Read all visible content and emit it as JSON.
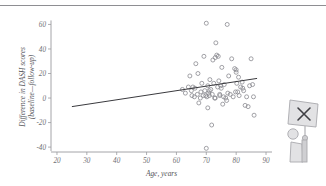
{
  "figure": {
    "has_top_rule": true,
    "background_color": "#ffffff"
  },
  "watermark": {
    "name": "person-holding-sign-with-x",
    "sign_glyph": "X"
  },
  "chart_data": {
    "type": "scatter",
    "title": "",
    "subtitle": "",
    "xlabel": "Age, years",
    "ylabel": "Difference in DASH scores (baseline—follow-up)",
    "ylabel_line1": "Difference in DASH scores",
    "ylabel_line2": "(baseline—follow-up)",
    "xlim": [
      18,
      92
    ],
    "ylim": [
      -44,
      62
    ],
    "xticks": [
      20,
      30,
      40,
      50,
      60,
      70,
      80,
      90
    ],
    "xtick_labels": [
      "20",
      "30",
      "40",
      "50",
      "60",
      "70",
      "80",
      "90"
    ],
    "yticks": [
      -40,
      -20,
      0,
      20,
      40,
      60
    ],
    "ytick_labels": [
      "-40",
      "-20",
      "0",
      "20",
      "40",
      "60"
    ],
    "grid": false,
    "legend": null,
    "marker_style": "open-circle",
    "marker_color": "#8a8a90",
    "trendline": {
      "type": "linear-fit",
      "color": "#3a3a3e",
      "x_start": 25,
      "y_start": -7,
      "x_end": 87,
      "y_end": 16
    },
    "x": [
      64.5,
      65.0,
      65.2,
      65.5,
      66.0,
      66.2,
      66.5,
      67.0,
      67.2,
      67.5,
      68.0,
      68.2,
      68.5,
      69.0,
      69.2,
      69.5,
      70.0,
      70.0,
      70.2,
      70.5,
      70.5,
      70.8,
      71.0,
      71.2,
      71.5,
      71.8,
      72.0,
      72.2,
      72.5,
      72.8,
      73.0,
      73.2,
      73.5,
      73.8,
      74.0,
      74.2,
      74.5,
      74.8,
      75.0,
      75.2,
      75.5,
      75.8,
      76.0,
      76.5,
      77.0,
      77.2,
      77.5,
      78.0,
      78.5,
      79.0,
      79.5,
      80.0,
      80.0,
      80.2,
      80.5,
      80.8,
      81.0,
      81.5,
      82.0,
      82.5,
      83.0,
      83.5,
      84.0,
      84.5,
      85.0,
      85.5,
      86.0,
      62.0,
      63.0,
      64.0,
      69.8,
      71.0,
      73.0,
      74.5,
      76.8,
      79.8,
      82.2,
      85.8
    ],
    "y": [
      18.0,
      6.0,
      2.0,
      9.0,
      1.0,
      8.0,
      28.0,
      3.0,
      20.0,
      -4.0,
      0.0,
      5.0,
      12.0,
      2.0,
      34.0,
      6.0,
      61.0,
      -41.0,
      1.0,
      10.0,
      -8.0,
      4.0,
      2.0,
      15.0,
      7.0,
      -22.0,
      3.0,
      31.0,
      12.0,
      0.0,
      33.0,
      45.0,
      35.0,
      9.0,
      34.0,
      14.0,
      2.0,
      10.0,
      8.0,
      25.0,
      -5.0,
      1.0,
      11.0,
      0.0,
      60.0,
      4.0,
      18.0,
      3.0,
      32.0,
      1.0,
      24.0,
      23.0,
      21.0,
      12.0,
      5.0,
      17.0,
      2.0,
      9.0,
      13.0,
      6.0,
      -6.0,
      1.0,
      -7.0,
      10.0,
      32.0,
      11.0,
      -14.0,
      7.0,
      4.0,
      9.0,
      2.0,
      6.0,
      0.0,
      3.0,
      -2.0,
      5.0,
      8.0,
      1.0
    ]
  }
}
